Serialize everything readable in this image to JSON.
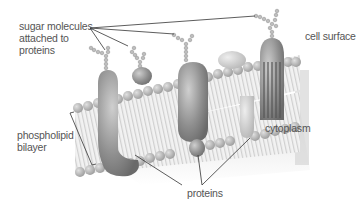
{
  "diagram": {
    "type": "cell membrane illustration",
    "labels": {
      "sugar_molecules": [
        "sugar molecules",
        "attached to",
        "proteins"
      ],
      "cell_surface": "cell surface",
      "phospholipid_bilayer": [
        "phospholipid",
        "bilayer"
      ],
      "cytoplasm": "cytoplasm",
      "proteins": "proteins"
    },
    "colors": {
      "background": "#ffffff",
      "label_text": "#555555",
      "leader_line": "#333333",
      "protein": "#9a9a9a",
      "lipid_head": "#b8b8b8",
      "lipid_tail": "#e6e6e6"
    }
  }
}
